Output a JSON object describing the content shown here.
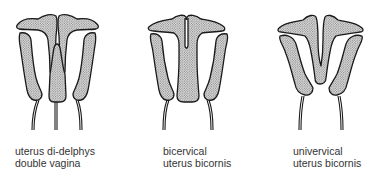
{
  "figures": [
    {
      "id": "uterus-didelphys",
      "caption_line1": "uterus di-delphys",
      "caption_line2": "double vagina"
    },
    {
      "id": "bicervical-bicornis",
      "caption_line1": "bicervical",
      "caption_line2": "uterus bicornis"
    },
    {
      "id": "univervical-bicornis",
      "caption_line1": "univervical",
      "caption_line2": "uterus bicornis"
    }
  ],
  "style": {
    "fill_pattern": "stipple-dots",
    "outline_color": "#1a1a1a",
    "background": "#ffffff"
  }
}
